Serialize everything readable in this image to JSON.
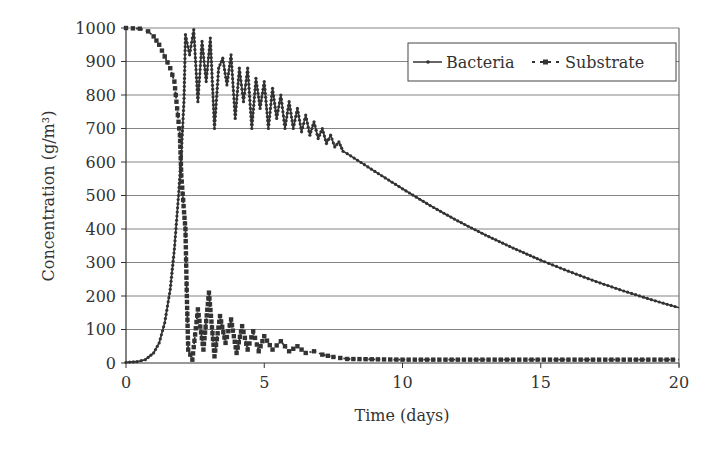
{
  "chart_data": {
    "type": "line",
    "title": "",
    "xlabel": "Time (days)",
    "ylabel": "Concentration (g/m³)",
    "xlim": [
      0,
      20
    ],
    "ylim": [
      0,
      1000
    ],
    "xticks": [
      0,
      5,
      10,
      15,
      20
    ],
    "yticks": [
      0,
      100,
      200,
      300,
      400,
      500,
      600,
      700,
      800,
      900,
      1000
    ],
    "grid": {
      "horizontal": true,
      "vertical": false
    },
    "legend": {
      "position": "top-right",
      "entries": [
        "Bacteria",
        "Substrate"
      ]
    },
    "series": [
      {
        "name": "Bacteria",
        "style": "solid line with small diamond markers",
        "points": [
          [
            0,
            2
          ],
          [
            0.4,
            4
          ],
          [
            0.7,
            10
          ],
          [
            1.0,
            30
          ],
          [
            1.2,
            60
          ],
          [
            1.4,
            120
          ],
          [
            1.6,
            220
          ],
          [
            1.75,
            340
          ],
          [
            1.9,
            500
          ],
          [
            2.0,
            620
          ],
          [
            2.1,
            790
          ],
          [
            2.15,
            980
          ],
          [
            2.3,
            920
          ],
          [
            2.45,
            995
          ],
          [
            2.6,
            780
          ],
          [
            2.75,
            960
          ],
          [
            2.9,
            840
          ],
          [
            3.05,
            970
          ],
          [
            3.2,
            700
          ],
          [
            3.35,
            880
          ],
          [
            3.5,
            910
          ],
          [
            3.65,
            830
          ],
          [
            3.8,
            920
          ],
          [
            3.95,
            730
          ],
          [
            4.1,
            880
          ],
          [
            4.25,
            780
          ],
          [
            4.4,
            880
          ],
          [
            4.55,
            700
          ],
          [
            4.7,
            850
          ],
          [
            4.85,
            760
          ],
          [
            5.0,
            840
          ],
          [
            5.15,
            700
          ],
          [
            5.3,
            820
          ],
          [
            5.45,
            730
          ],
          [
            5.6,
            800
          ],
          [
            5.75,
            700
          ],
          [
            5.9,
            780
          ],
          [
            6.05,
            700
          ],
          [
            6.2,
            760
          ],
          [
            6.35,
            690
          ],
          [
            6.5,
            740
          ],
          [
            6.65,
            680
          ],
          [
            6.8,
            720
          ],
          [
            6.95,
            670
          ],
          [
            7.1,
            700
          ],
          [
            7.25,
            655
          ],
          [
            7.4,
            680
          ],
          [
            7.55,
            645
          ],
          [
            7.7,
            660
          ],
          [
            7.85,
            632
          ],
          [
            8,
            625
          ],
          [
            9,
            572
          ],
          [
            10,
            520
          ],
          [
            11,
            470
          ],
          [
            12,
            424
          ],
          [
            13,
            382
          ],
          [
            14,
            343
          ],
          [
            15,
            307
          ],
          [
            16,
            274
          ],
          [
            17,
            243
          ],
          [
            18,
            215
          ],
          [
            19,
            189
          ],
          [
            20,
            165
          ]
        ]
      },
      {
        "name": "Substrate",
        "style": "dotted line with square markers",
        "points": [
          [
            0,
            1000
          ],
          [
            0.5,
            998
          ],
          [
            0.8,
            990
          ],
          [
            1.0,
            975
          ],
          [
            1.2,
            950
          ],
          [
            1.4,
            915
          ],
          [
            1.6,
            880
          ],
          [
            1.75,
            840
          ],
          [
            1.85,
            760
          ],
          [
            1.95,
            680
          ],
          [
            2.0,
            560
          ],
          [
            2.1,
            450
          ],
          [
            2.15,
            400
          ],
          [
            2.2,
            200
          ],
          [
            2.25,
            40
          ],
          [
            2.4,
            10
          ],
          [
            2.6,
            160
          ],
          [
            2.8,
            40
          ],
          [
            3.0,
            210
          ],
          [
            3.2,
            20
          ],
          [
            3.4,
            140
          ],
          [
            3.6,
            60
          ],
          [
            3.8,
            130
          ],
          [
            4.0,
            30
          ],
          [
            4.2,
            110
          ],
          [
            4.4,
            40
          ],
          [
            4.6,
            95
          ],
          [
            4.8,
            35
          ],
          [
            5.0,
            80
          ],
          [
            5.3,
            40
          ],
          [
            5.6,
            65
          ],
          [
            5.9,
            35
          ],
          [
            6.2,
            50
          ],
          [
            6.5,
            30
          ],
          [
            6.8,
            35
          ],
          [
            7.1,
            25
          ],
          [
            7.5,
            18
          ],
          [
            8,
            12
          ],
          [
            10,
            10
          ],
          [
            12,
            10
          ],
          [
            14,
            10
          ],
          [
            16,
            10
          ],
          [
            18,
            10
          ],
          [
            20,
            10
          ]
        ]
      }
    ]
  }
}
